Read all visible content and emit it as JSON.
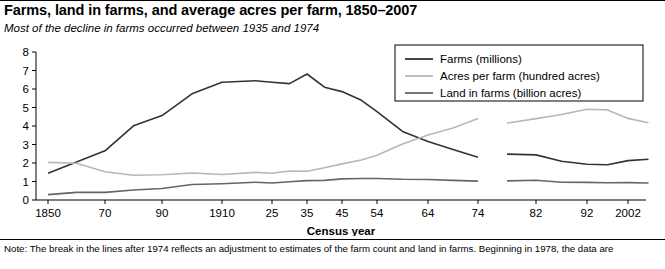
{
  "title": "Farms, land in farms, and average acres per farm, 1850–2007",
  "subtitle": "Most of the decline in farms occurred between 1935 and 1974",
  "note": "Note: The break in the lines after 1974 reflects an adjustment to estimates of the farm count and land in farms. Beginning in 1978, the data are",
  "chart_data": {
    "type": "line",
    "title": "Farms, land in farms, and average acres per farm, 1850–2007",
    "subtitle": "Most of the decline in farms occurred between 1935 and 1974",
    "xlabel": "Census year",
    "ylabel": "",
    "ylim": [
      0,
      8
    ],
    "yticks": [
      0,
      1,
      2,
      3,
      4,
      5,
      6,
      7,
      8
    ],
    "xticks": [
      "1850",
      "70",
      "90",
      "1910",
      "25",
      "35",
      "45",
      "54",
      "64",
      "74",
      "82",
      "92",
      "2002"
    ],
    "grid": false,
    "legend_position": "top-right",
    "break_after": 1974,
    "series": [
      {
        "name": "Farms (millions)",
        "color": "#333333",
        "x": [
          1850,
          1860,
          1870,
          1880,
          1890,
          1900,
          1910,
          1920,
          1925,
          1930,
          1935,
          1940,
          1945,
          1950,
          1954,
          1959,
          1964,
          1969,
          1974,
          1978,
          1982,
          1987,
          1992,
          1997,
          2002,
          2007
        ],
        "values": [
          1.45,
          2.05,
          2.66,
          4.01,
          4.56,
          5.74,
          6.36,
          6.45,
          6.37,
          6.29,
          6.81,
          6.1,
          5.86,
          5.39,
          4.78,
          3.71,
          3.16,
          2.73,
          2.31,
          2.48,
          2.44,
          2.09,
          1.93,
          1.91,
          2.13,
          2.2
        ]
      },
      {
        "name": "Acres per farm (hundred acres)",
        "color": "#b8b8b8",
        "x": [
          1850,
          1860,
          1870,
          1880,
          1890,
          1900,
          1910,
          1920,
          1925,
          1930,
          1935,
          1940,
          1945,
          1950,
          1954,
          1959,
          1964,
          1969,
          1974,
          1978,
          1982,
          1987,
          1992,
          1997,
          2002,
          2007
        ],
        "values": [
          2.03,
          1.99,
          1.53,
          1.34,
          1.37,
          1.46,
          1.38,
          1.49,
          1.45,
          1.57,
          1.55,
          1.74,
          1.95,
          2.16,
          2.42,
          3.03,
          3.52,
          3.9,
          4.4,
          4.15,
          4.4,
          4.62,
          4.91,
          4.87,
          4.41,
          4.18
        ]
      },
      {
        "name": "Land in farms (billion acres)",
        "color": "#666666",
        "x": [
          1850,
          1860,
          1870,
          1880,
          1890,
          1900,
          1910,
          1920,
          1925,
          1930,
          1935,
          1940,
          1945,
          1950,
          1954,
          1959,
          1964,
          1969,
          1974,
          1978,
          1982,
          1987,
          1992,
          1997,
          2002,
          2007
        ],
        "values": [
          0.29,
          0.41,
          0.41,
          0.54,
          0.62,
          0.84,
          0.88,
          0.96,
          0.92,
          0.99,
          1.05,
          1.06,
          1.14,
          1.16,
          1.16,
          1.12,
          1.11,
          1.06,
          1.02,
          1.03,
          1.07,
          0.96,
          0.95,
          0.93,
          0.94,
          0.92
        ]
      }
    ],
    "legend": [
      {
        "label": "Farms (millions)",
        "color": "#333333"
      },
      {
        "label": "Acres per farm (hundred acres)",
        "color": "#b8b8b8"
      },
      {
        "label": "Land in farms (billion acres)",
        "color": "#666666"
      }
    ]
  }
}
